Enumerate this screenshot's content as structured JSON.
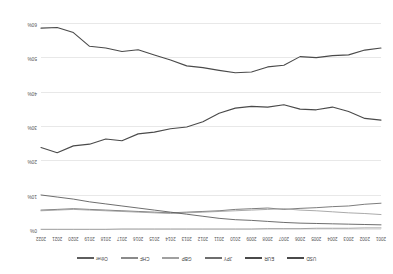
{
  "chart_data": {
    "type": "line",
    "title": "",
    "subtitle": "",
    "xlabel": "",
    "ylabel": "",
    "grid": true,
    "legend_position": "top",
    "ylim": [
      0,
      60
    ],
    "yticks": [
      "0%",
      "10%",
      "20%",
      "30%",
      "40%",
      "50%",
      "60%"
    ],
    "ytick_values": [
      0,
      10,
      20,
      30,
      40,
      50,
      60
    ],
    "categories": [
      "2001",
      "2002",
      "2003",
      "2004",
      "2005",
      "2006",
      "2007",
      "2008",
      "2009",
      "2010",
      "2011",
      "2012",
      "2013",
      "2014",
      "2015",
      "2016",
      "2017",
      "2018",
      "2019",
      "2020",
      "2021",
      "2022"
    ],
    "x": [
      2001,
      2002,
      2003,
      2004,
      2005,
      2006,
      2007,
      2008,
      2009,
      2010,
      2011,
      2012,
      2013,
      2014,
      2015,
      2016,
      2017,
      2018,
      2019,
      2020,
      2021,
      2022
    ],
    "series": [
      {
        "name": "USD",
        "color": "#4a4a4a",
        "width": 1.1,
        "values": [
          53.0,
          52.4,
          51.0,
          50.8,
          50.2,
          50.5,
          48.0,
          47.5,
          46.0,
          45.8,
          46.5,
          47.3,
          47.8,
          49.5,
          51.0,
          52.5,
          52.0,
          53.0,
          53.5,
          57.5,
          59.0,
          58.8
        ]
      },
      {
        "name": "EUR",
        "color": "#4a4a4a",
        "width": 1.1,
        "values": [
          32.0,
          32.5,
          34.5,
          35.8,
          35.0,
          35.2,
          36.5,
          35.8,
          36.0,
          35.5,
          34.0,
          31.5,
          30.0,
          29.5,
          28.5,
          28.0,
          26.0,
          26.5,
          25.0,
          24.5,
          22.5,
          24.0
        ]
      },
      {
        "name": "JPY",
        "color": "#6e6e6e",
        "width": 0.9,
        "values": [
          7.8,
          7.5,
          7.0,
          6.8,
          6.5,
          6.3,
          6.0,
          6.4,
          6.2,
          6.0,
          5.6,
          5.4,
          5.2,
          5.0,
          5.2,
          5.4,
          5.6,
          5.8,
          6.0,
          6.2,
          6.0,
          5.8
        ]
      },
      {
        "name": "GBP",
        "color": "#a0a0a0",
        "width": 0.9,
        "values": [
          4.5,
          4.8,
          5.0,
          5.3,
          5.6,
          5.8,
          6.2,
          6.0,
          5.8,
          5.6,
          5.4,
          5.2,
          5.0,
          4.8,
          5.0,
          5.2,
          5.4,
          5.6,
          5.8,
          6.0,
          5.8,
          5.6
        ]
      },
      {
        "name": "CHF",
        "color": "#8a8a8a",
        "width": 0.8,
        "values": [
          0.6,
          0.6,
          0.5,
          0.5,
          0.5,
          0.4,
          0.4,
          0.4,
          0.3,
          0.3,
          0.3,
          0.3,
          0.3,
          0.3,
          0.3,
          0.3,
          0.3,
          0.2,
          0.2,
          0.2,
          0.2,
          0.2
        ]
      },
      {
        "name": "Other",
        "color": "#5e5e5e",
        "width": 0.9,
        "values": [
          1.5,
          1.6,
          1.7,
          1.8,
          1.9,
          2.0,
          2.2,
          2.5,
          2.8,
          3.0,
          3.4,
          4.0,
          4.6,
          5.2,
          5.8,
          6.4,
          7.0,
          7.6,
          8.2,
          9.0,
          9.6,
          10.2
        ]
      }
    ]
  },
  "legend": {
    "items": [
      {
        "label": "USD",
        "color": "#4a4a4a"
      },
      {
        "label": "EUR",
        "color": "#4a4a4a"
      },
      {
        "label": "JPY",
        "color": "#6e6e6e"
      },
      {
        "label": "GBP",
        "color": "#a0a0a0"
      },
      {
        "label": "CHF",
        "color": "#8a8a8a"
      },
      {
        "label": "Other",
        "color": "#5e5e5e"
      }
    ]
  }
}
